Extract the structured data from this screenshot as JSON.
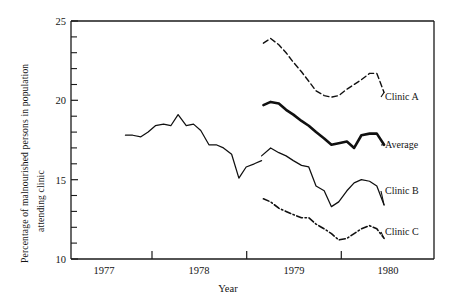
{
  "chart_data": {
    "type": "line",
    "title": "",
    "xlabel": "Year",
    "ylabel": "Percentage of malnourished persons in population attending clinic",
    "ylabel_line1": "Percentage of malnourished persons in population",
    "ylabel_line2": "attending clinic",
    "xlim": [
      1976.5,
      1980.5
    ],
    "ylim": [
      10,
      25
    ],
    "ytick_labels": [
      "25",
      "20",
      "15",
      "10"
    ],
    "ytick_values": [
      25,
      20,
      15,
      10
    ],
    "yminor_values": [
      24,
      23,
      22,
      21,
      19,
      18,
      17,
      16,
      14,
      13,
      12,
      11
    ],
    "xtick_values": [
      1977,
      1978,
      1979,
      1980
    ],
    "xtick_labels": [
      "1977",
      "1978",
      "1979",
      "1980"
    ],
    "xtick_label_positions": [
      1977.5,
      1978.5,
      1979.5,
      1980.0
    ],
    "grid": false,
    "legend_position": "right-outside",
    "series": [
      {
        "name": "Clinic A",
        "style": "dashed",
        "label_y": 20.6,
        "x": [
          1978.62,
          1978.7,
          1978.79,
          1978.87,
          1978.95,
          1979.04,
          1979.12,
          1979.2,
          1979.29,
          1979.37,
          1979.45,
          1979.54,
          1979.62,
          1979.7,
          1979.79,
          1979.87,
          1979.95
        ],
        "values": [
          23.6,
          23.9,
          23.5,
          23.0,
          22.4,
          21.8,
          21.2,
          20.6,
          20.3,
          20.2,
          20.3,
          20.7,
          21.0,
          21.3,
          21.7,
          21.7,
          20.5
        ]
      },
      {
        "name": "Average",
        "style": "mixed-thin-thick",
        "label_y": 17.2,
        "x_thin": [
          1977.1,
          1977.18,
          1977.27,
          1977.35,
          1977.43,
          1977.52,
          1977.6,
          1977.68,
          1977.77,
          1977.85,
          1977.93,
          1978.02,
          1978.1,
          1978.18,
          1978.27,
          1978.35,
          1978.43,
          1978.52,
          1978.6
        ],
        "values_thin": [
          17.8,
          17.8,
          17.7,
          18.0,
          18.4,
          18.5,
          18.4,
          19.1,
          18.4,
          18.5,
          18.1,
          17.2,
          17.2,
          17.0,
          16.6,
          15.1,
          15.8,
          16.0,
          16.2
        ],
        "x_thick": [
          1978.62,
          1978.7,
          1978.79,
          1978.87,
          1978.95,
          1979.04,
          1979.12,
          1979.2,
          1979.29,
          1979.37,
          1979.45,
          1979.54,
          1979.62,
          1979.7,
          1979.79,
          1979.87,
          1979.95
        ],
        "values_thick": [
          19.7,
          19.9,
          19.8,
          19.4,
          19.1,
          18.7,
          18.4,
          18.0,
          17.6,
          17.2,
          17.3,
          17.4,
          17.0,
          17.8,
          17.9,
          17.9,
          17.2
        ]
      },
      {
        "name": "Clinic B",
        "style": "solid-thin",
        "label_y": 14.3,
        "x": [
          1978.6,
          1978.7,
          1978.79,
          1978.87,
          1978.95,
          1979.04,
          1979.12,
          1979.2,
          1979.29,
          1979.37,
          1979.45,
          1979.54,
          1979.62,
          1979.7,
          1979.79,
          1979.87,
          1979.95
        ],
        "values": [
          16.5,
          17.0,
          16.7,
          16.5,
          16.2,
          15.9,
          15.8,
          14.6,
          14.3,
          13.3,
          13.6,
          14.3,
          14.8,
          15.0,
          14.9,
          14.6,
          13.4
        ]
      },
      {
        "name": "Clinic C",
        "style": "dash-dot",
        "label_y": 11.3,
        "x": [
          1978.62,
          1978.7,
          1978.79,
          1978.87,
          1978.95,
          1979.04,
          1979.12,
          1979.2,
          1979.29,
          1979.37,
          1979.45,
          1979.54,
          1979.62,
          1979.7,
          1979.79,
          1979.87,
          1979.95
        ],
        "values": [
          13.8,
          13.6,
          13.2,
          13.0,
          12.8,
          12.6,
          12.6,
          12.2,
          11.9,
          11.6,
          11.2,
          11.3,
          11.6,
          11.9,
          12.1,
          11.9,
          11.3
        ]
      }
    ]
  },
  "series_labels": {
    "clinic_a": "Clinic A",
    "average": "Average",
    "clinic_b": "Clinic B",
    "clinic_c": "Clinic C"
  },
  "axis": {
    "x_title": "Year",
    "y_title_line1": "Percentage of malnourished persons in population",
    "y_title_line2": "attending clinic",
    "y_25": "25",
    "y_20": "20",
    "y_15": "15",
    "y_10": "10",
    "x_1977": "1977",
    "x_1978": "1978",
    "x_1979": "1979",
    "x_1980": "1980"
  },
  "colors": {
    "ink": "#101010",
    "background": "#ffffff"
  }
}
